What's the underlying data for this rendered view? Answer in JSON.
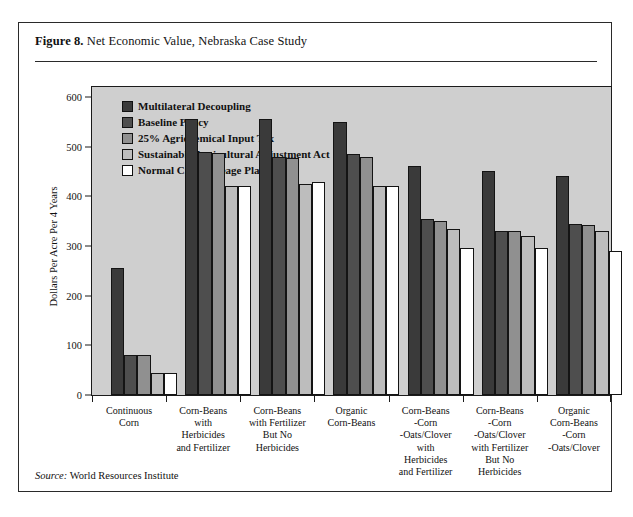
{
  "figure": {
    "number": "Figure 8.",
    "title": "Net Economic Value, Nebraska Case Study",
    "source_label": "Source:",
    "source_text": "World Resources Institute"
  },
  "chart_data": {
    "type": "bar",
    "title": "Net Economic Value, Nebraska Case Study",
    "xlabel": "",
    "ylabel": "Dollars Per Acre Per 4 Years",
    "ylim": [
      0,
      620
    ],
    "yticks": [
      0,
      100,
      200,
      300,
      400,
      500,
      600
    ],
    "ytick_labels": [
      "0",
      "100",
      "200",
      "300",
      "400",
      "500",
      "600"
    ],
    "grid": false,
    "legend_position": "upper-left-inside",
    "plot_background": "#cfcfcf",
    "categories": [
      "Continuous\nCorn",
      "Corn-Beans\nwith\nHerbicides\nand Fertilizer",
      "Corn-Beans\nwith Fertilizer\nBut No\nHerbicides",
      "Organic\nCorn-Beans",
      "Corn-Beans\n-Corn\n-Oats/Clover\nwith\nHerbicides\nand Fertilizer",
      "Corn-Beans\n-Corn\n-Oats/Clover\nwith Fertilizer\nBut No\nHerbicides",
      "Organic\nCorn-Beans\n-Corn\n-Oats/Clover"
    ],
    "series": [
      {
        "name": "Multilateral Decoupling",
        "color": "#3a3a3a",
        "values": [
          255,
          555,
          555,
          550,
          460,
          450,
          440
        ]
      },
      {
        "name": "Baseline Policy",
        "color": "#4e4e4e",
        "values": [
          80,
          490,
          480,
          485,
          355,
          330,
          345
        ]
      },
      {
        "name": "25%  Agrichemical Input Tax",
        "color": "#909090",
        "values": [
          80,
          488,
          478,
          480,
          350,
          330,
          343
        ]
      },
      {
        "name": "Sustainable Agricultural Adjustment Act",
        "color": "#bdbdbd",
        "values": [
          45,
          420,
          425,
          420,
          335,
          320,
          330
        ]
      },
      {
        "name": "Normal Crop Acreage Plan",
        "color": "#ffffff",
        "values": [
          45,
          420,
          428,
          420,
          295,
          295,
          290
        ]
      }
    ]
  }
}
